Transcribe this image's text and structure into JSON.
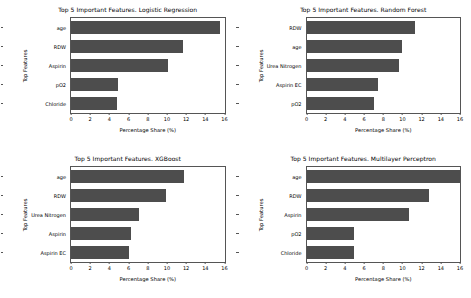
{
  "figure": {
    "background": "#ffffff",
    "bar_color": "#4d4d4d",
    "axis_color": "#555555"
  },
  "chart_data": [
    {
      "type": "bar",
      "orientation": "horizontal",
      "title": "Top 5 Important Features. Logistic Regression",
      "xlabel": "Percentage Share (%)",
      "ylabel": "Top Features",
      "categories": [
        "age",
        "RDW",
        "Aspirin",
        "pO2",
        "Chloride"
      ],
      "values": [
        15.5,
        11.7,
        10.1,
        4.9,
        4.8
      ],
      "xlim": [
        0,
        16
      ],
      "xticks": [
        0,
        2,
        4,
        6,
        8,
        10,
        12,
        14,
        16
      ],
      "xticklabels": [
        "0",
        "2",
        "4",
        "6",
        "8",
        "10",
        "12",
        "14",
        "16"
      ],
      "grid": false,
      "legend": false
    },
    {
      "type": "bar",
      "orientation": "horizontal",
      "title": "Top 5 Important Features. Random Forest",
      "xlabel": "Percentage Share (%)",
      "ylabel": "Top Features",
      "categories": [
        "RDW",
        "age",
        "Urea Nitrogen",
        "Aspirin EC",
        "pO2"
      ],
      "values": [
        11.3,
        10.0,
        9.6,
        7.5,
        7.0
      ],
      "xlim": [
        0,
        16
      ],
      "xticks": [
        0,
        2,
        4,
        6,
        8,
        10,
        12,
        14,
        16
      ],
      "xticklabels": [
        "0",
        "2",
        "4",
        "6",
        "8",
        "10",
        "12",
        "14",
        "16"
      ],
      "grid": false,
      "legend": false
    },
    {
      "type": "bar",
      "orientation": "horizontal",
      "title": "Top 5 Important Features. XGBoost",
      "xlabel": "Percentage Share (%)",
      "ylabel": "Top Features",
      "categories": [
        "age",
        "RDW",
        "Urea Nitrogen",
        "Aspirin",
        "Aspirin EC"
      ],
      "values": [
        11.8,
        9.9,
        7.1,
        6.3,
        6.0
      ],
      "xlim": [
        0,
        16
      ],
      "xticks": [
        0,
        2,
        4,
        6,
        8,
        10,
        12,
        14,
        16
      ],
      "xticklabels": [
        "0",
        "2",
        "4",
        "6",
        "8",
        "10",
        "12",
        "14",
        "16"
      ],
      "grid": false,
      "legend": false
    },
    {
      "type": "bar",
      "orientation": "horizontal",
      "title": "Top 5 Important Features. Multilayer Perceptron",
      "xlabel": "Percentage Share (%)",
      "ylabel": "Top Features",
      "categories": [
        "age",
        "RDW",
        "Aspirin",
        "pO2",
        "Chloride"
      ],
      "values": [
        16.2,
        12.8,
        10.7,
        5.0,
        4.9
      ],
      "xlim": [
        0,
        16
      ],
      "xticks": [
        0,
        2,
        4,
        6,
        8,
        10,
        12,
        14,
        16
      ],
      "xticklabels": [
        "0",
        "2",
        "4",
        "6",
        "8",
        "10",
        "12",
        "14",
        "16"
      ],
      "grid": false,
      "legend": false
    }
  ]
}
